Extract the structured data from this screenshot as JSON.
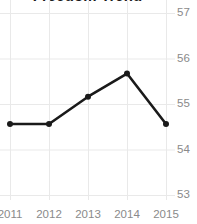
{
  "chart_data": {
    "type": "line",
    "title": "Freedom Trend",
    "xlabel": "",
    "ylabel": "",
    "categories": [
      "2011",
      "2012",
      "2013",
      "2014",
      "2015"
    ],
    "x": [
      2011,
      2012,
      2013,
      2014,
      2015
    ],
    "values": [
      54.56,
      54.56,
      55.16,
      55.67,
      54.56
    ],
    "series": [
      {
        "name": "Freedom Trend",
        "values": [
          54.56,
          54.56,
          55.16,
          55.67,
          54.56
        ],
        "color": "#1a1a1a",
        "marker": "circle"
      }
    ],
    "ylim": [
      53,
      57
    ],
    "yticks": [
      53,
      54,
      55,
      56,
      57
    ],
    "ytick_labels": [
      "53",
      "54",
      "55",
      "56",
      "57"
    ],
    "xticks": [
      2011,
      2012,
      2013,
      2014,
      2015
    ],
    "xtick_labels": [
      "2011",
      "2012",
      "2013",
      "2014",
      "2015"
    ],
    "grid": true,
    "grid_axis": "both",
    "legend": false,
    "legend_position": "none",
    "y_axis_position": "right",
    "colors": {
      "line": "#1a1a1a",
      "marker": "#1a1a1a",
      "grid": "#e9e9e9",
      "tick_label": "#8a8a8a",
      "title": "#1b1b1b",
      "background": "#ffffff"
    }
  }
}
